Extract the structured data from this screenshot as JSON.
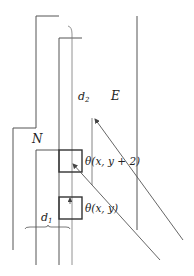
{
  "diagram": {
    "labels": {
      "d2": "d",
      "d2_sub": "2",
      "E": "E",
      "N": "N",
      "theta_top": "θ(x, y + 2)",
      "theta_bottom": "θ(x, y)",
      "d1": "d",
      "d1_sub": "1"
    },
    "colors": {
      "line": "#555555",
      "box": "#333333",
      "text": "#222222"
    }
  }
}
